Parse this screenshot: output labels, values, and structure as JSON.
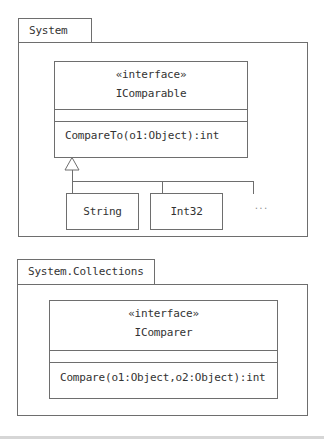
{
  "diagram_type": "UML class diagram",
  "packages": [
    {
      "name": "System",
      "interface": {
        "stereotype": "«interface»",
        "name": "IComparable",
        "attributes": [],
        "operations": [
          "CompareTo(o1:Object):int"
        ]
      },
      "implementors": [
        "String",
        "Int32"
      ],
      "more_indicator": "..."
    },
    {
      "name": "System.Collections",
      "interface": {
        "stereotype": "«interface»",
        "name": "IComparer",
        "attributes": [],
        "operations": [
          "Compare(o1:Object,o2:Object):int"
        ]
      }
    }
  ],
  "relationships": [
    {
      "type": "realization",
      "from": "String",
      "to": "IComparable"
    },
    {
      "type": "realization",
      "from": "Int32",
      "to": "IComparable"
    },
    {
      "type": "realization",
      "from": "...",
      "to": "IComparable"
    }
  ]
}
